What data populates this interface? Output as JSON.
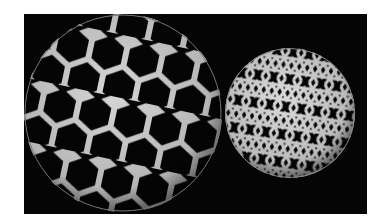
{
  "image": {
    "description": "Two woven spherical lattices on a black background",
    "background_color": "#050505",
    "strip_color": "#d8d8d8",
    "spheres": [
      {
        "name": "large-hexagonal-woven-sphere",
        "cx": 99,
        "cy": 99,
        "r": 100,
        "pattern": "hexagons-and-pentagons"
      },
      {
        "name": "small-triangular-woven-sphere",
        "cx": 266,
        "cy": 99,
        "r": 66,
        "pattern": "triaxial-kagome"
      }
    ]
  }
}
